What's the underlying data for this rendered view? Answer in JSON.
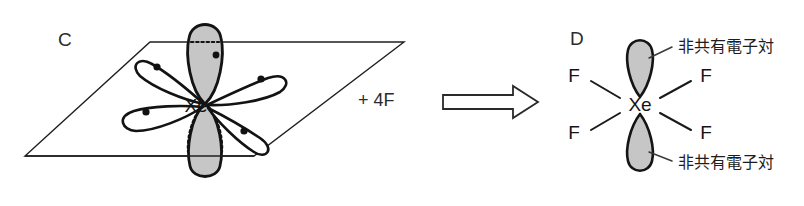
{
  "figure": {
    "background_color": "#ffffff",
    "width": 804,
    "height": 206
  },
  "colors": {
    "stroke": "#131313",
    "plane_stroke": "#1f1f1f",
    "lobe_fill_gray": "#c6c6c6",
    "lobe_fill_white": "#ffffff",
    "electron_dot": "#111111",
    "text": "#1a1a1a",
    "arrow_fill": "#ffffff",
    "arrow_stroke": "#2a2a2a"
  },
  "panels": [
    {
      "id": "C",
      "label": "C",
      "description": "sp3d2 hybrid orbital set on Xe with four in-plane lobes each holding one electron, and two axial lone-pair lobes",
      "center_atom": "Xe",
      "plane": {
        "name": "equatorial-plane",
        "shape": "parallelogram",
        "points": "150,42 404,42 254,156 25,156"
      },
      "inplane_orbitals": [
        {
          "name": "orbital-upper-left",
          "direction": "upper-left",
          "electrons": 1
        },
        {
          "name": "orbital-upper-right",
          "direction": "upper-right",
          "electrons": 1
        },
        {
          "name": "orbital-lower-left",
          "direction": "lower-left",
          "electrons": 1
        },
        {
          "name": "orbital-lower-right",
          "direction": "lower-right",
          "electrons": 1
        }
      ],
      "axial_orbitals": [
        {
          "name": "axial-lobe-top",
          "position": "above-plane",
          "fill": "gray",
          "outline": "solid"
        },
        {
          "name": "axial-lobe-bottom",
          "position": "below-plane",
          "fill": "gray",
          "outline": "dotted-where-hidden"
        }
      ]
    },
    {
      "id": "D",
      "label": "D",
      "description": "XeF4 square planar structure with two axial lone pairs",
      "center_atom": "Xe",
      "ligands": [
        {
          "name": "fluorine-upper-left",
          "label": "F",
          "position": "upper-left"
        },
        {
          "name": "fluorine-upper-right",
          "label": "F",
          "position": "upper-right"
        },
        {
          "name": "fluorine-lower-left",
          "label": "F",
          "position": "lower-left"
        },
        {
          "name": "fluorine-lower-right",
          "label": "F",
          "position": "lower-right"
        }
      ],
      "lone_pairs": [
        {
          "name": "lone-pair-top",
          "label": "非共有電子対",
          "position": "top"
        },
        {
          "name": "lone-pair-bottom",
          "label": "非共有電子対",
          "position": "bottom"
        }
      ]
    }
  ],
  "reaction": {
    "reagent_label": "+ 4F",
    "arrow": {
      "name": "reaction-arrow",
      "style": "hollow-block-arrow",
      "direction": "right"
    }
  }
}
